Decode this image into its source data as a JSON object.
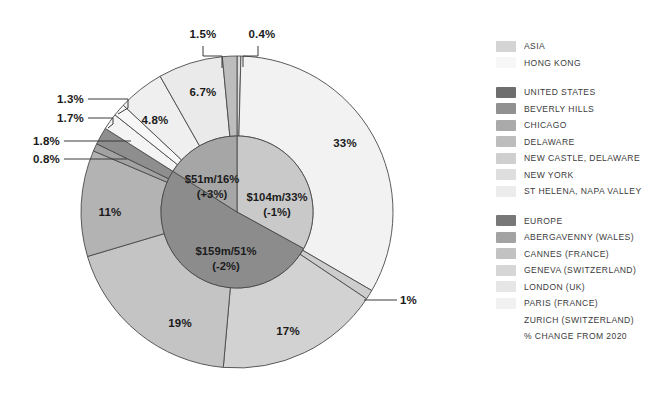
{
  "chart_data": {
    "type": "pie",
    "title": "",
    "subtype": "nested-donut",
    "center": {
      "x": 237,
      "y": 212
    },
    "inner_radius": 76,
    "outer_radius": 156,
    "start_angle_deg": 0,
    "direction": "clockwise",
    "inner_ring": {
      "name": "Region",
      "slices": [
        {
          "label": "UNITED STATES",
          "value": 33,
          "amount": "$104m",
          "change": "-1%",
          "display": "$104m/33%",
          "display_change": "(-1%)",
          "color": "#c9c9c9"
        },
        {
          "label": "EUROPE",
          "value": 51,
          "amount": "$159m",
          "change": "-2%",
          "display": "$159m/51%",
          "display_change": "(-2%)",
          "color": "#8c8c8c"
        },
        {
          "label": "ASIA",
          "value": 16,
          "amount": "$51m",
          "change": "+3%",
          "display": "$51m/16%",
          "display_change": "(+3%)",
          "color": "#a6a6a6"
        }
      ]
    },
    "outer_ring": {
      "name": "City",
      "slices": [
        {
          "label": "ST HELENA, NAPA VALLEY",
          "value": 0.4,
          "display": "0.4%",
          "color": "#dedede",
          "group": "UNITED STATES"
        },
        {
          "label": "NEW YORK",
          "value": 33,
          "display": "33%",
          "color": "#f2f2f2",
          "group": "UNITED STATES"
        },
        {
          "label": "NEW CASTLE, DELAWARE",
          "value": 1,
          "display": "1%",
          "color": "#cdcdcd",
          "group": "UNITED STATES"
        },
        {
          "label": "LONDON (UK)",
          "value": 17,
          "display": "17%",
          "color": "#d2d2d2",
          "group": "EUROPE"
        },
        {
          "label": "PARIS (FRANCE)",
          "value": 19,
          "display": "19%",
          "color": "#c4c4c4",
          "group": "EUROPE"
        },
        {
          "label": "GENEVA (SWITZERLAND)",
          "value": 11,
          "display": "11%",
          "color": "#b3b3b3",
          "group": "EUROPE"
        },
        {
          "label": "CANNES (FRANCE)",
          "value": 0.8,
          "display": "0.8%",
          "color": "#a2a2a2",
          "group": "EUROPE"
        },
        {
          "label": "ABERGAVENNY (WALES)",
          "value": 1.8,
          "display": "1.8%",
          "color": "#8e8e8e",
          "group": "EUROPE"
        },
        {
          "label": "ZURICH (SWITZERLAND)",
          "value": 1.7,
          "display": "1.7%",
          "color": "#f4f4f4",
          "group": "EUROPE"
        },
        {
          "label": "HONG KONG",
          "value": 1.3,
          "display": "1.3%",
          "color": "#f7f7f7",
          "group": "ASIA"
        },
        {
          "label": "DELAWARE",
          "value": 4.8,
          "display": "4.8%",
          "color": "#efefef",
          "group": "UNITED STATES"
        },
        {
          "label": "CHICAGO",
          "value": 6.7,
          "display": "6.7%",
          "color": "#eaeaea",
          "group": "UNITED STATES"
        },
        {
          "label": "BEVERLY HILLS",
          "value": 1.5,
          "display": "1.5%",
          "color": "#bdbdbd",
          "group": "UNITED STATES"
        }
      ]
    },
    "outer_labels": [
      {
        "text": "1.5%",
        "x": 203,
        "y": 38,
        "anchor": "middle"
      },
      {
        "text": "0.4%",
        "x": 262,
        "y": 38,
        "anchor": "middle"
      },
      {
        "text": "6.7%",
        "x": 203,
        "y": 96,
        "anchor": "middle"
      },
      {
        "text": "4.8%",
        "x": 155,
        "y": 124,
        "anchor": "middle"
      },
      {
        "text": "1.3%",
        "x": 84,
        "y": 103,
        "anchor": "end"
      },
      {
        "text": "1.7%",
        "x": 84,
        "y": 122,
        "anchor": "end"
      },
      {
        "text": "1.8%",
        "x": 60,
        "y": 145,
        "anchor": "end"
      },
      {
        "text": "0.8%",
        "x": 60,
        "y": 163,
        "anchor": "end"
      },
      {
        "text": "33%",
        "x": 345,
        "y": 147,
        "anchor": "middle"
      },
      {
        "text": "1%",
        "x": 400,
        "y": 304,
        "anchor": "start"
      },
      {
        "text": "11%",
        "x": 110,
        "y": 216,
        "anchor": "middle"
      },
      {
        "text": "19%",
        "x": 180,
        "y": 327,
        "anchor": "middle"
      },
      {
        "text": "17%",
        "x": 288,
        "y": 335,
        "anchor": "middle"
      }
    ],
    "inner_labels": [
      {
        "line1": "$51m/16%",
        "line2": "(+3%)",
        "x": 212,
        "y": 183
      },
      {
        "line1": "$104m/33%",
        "line2": "(-1%)",
        "x": 277,
        "y": 201
      },
      {
        "line1": "$159m/51%",
        "line2": "(-2%)",
        "x": 226,
        "y": 255
      }
    ],
    "legend_position": "right"
  },
  "legend": {
    "groups": [
      {
        "name": "asia-group",
        "items": [
          {
            "label": "ASIA",
            "color": "#d4d4d4",
            "bold": true
          },
          {
            "label": "HONG KONG",
            "color": "#f7f7f7",
            "bold": false
          }
        ]
      },
      {
        "name": "united-states-group",
        "items": [
          {
            "label": "UNITED STATES",
            "color": "#6e6e6e",
            "bold": true
          },
          {
            "label": "BEVERLY HILLS",
            "color": "#919191",
            "bold": false
          },
          {
            "label": "CHICAGO",
            "color": "#aaaaaa",
            "bold": false
          },
          {
            "label": "DELAWARE",
            "color": "#bdbdbd",
            "bold": false
          },
          {
            "label": "NEW CASTLE, DELAWARE",
            "color": "#cfcfcf",
            "bold": false
          },
          {
            "label": "NEW YORK",
            "color": "#dedede",
            "bold": false
          },
          {
            "label": "ST HELENA, NAPA VALLEY",
            "color": "#ececec",
            "bold": false
          }
        ]
      },
      {
        "name": "europe-group",
        "items": [
          {
            "label": "EUROPE",
            "color": "#787878",
            "bold": true
          },
          {
            "label": "ABERGAVENNY (WALES)",
            "color": "#a3a3a3",
            "bold": false
          },
          {
            "label": "CANNES (FRANCE)",
            "color": "#c2c2c2",
            "bold": false
          },
          {
            "label": "GENEVA (SWITZERLAND)",
            "color": "#d6d6d6",
            "bold": false
          },
          {
            "label": "LONDON (UK)",
            "color": "#e6e6e6",
            "bold": false
          },
          {
            "label": "PARIS (FRANCE)",
            "color": "#f1f1f1",
            "bold": false
          },
          {
            "label": "ZURICH (SWITZERLAND)",
            "color": "#ffffff",
            "bold": false
          },
          {
            "label": "% CHANGE FROM 2020",
            "color": "transparent",
            "bold": false
          }
        ]
      }
    ]
  }
}
